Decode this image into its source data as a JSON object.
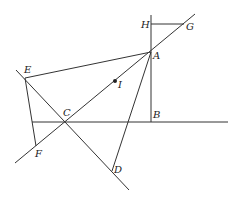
{
  "diagram": {
    "type": "geometry",
    "colors": {
      "line": "#333333",
      "label": "#222222",
      "background": "#ffffff"
    },
    "points": {
      "A": {
        "label": "A",
        "x": 151,
        "y": 52
      },
      "B": {
        "label": "B",
        "x": 151,
        "y": 122
      },
      "C": {
        "label": "C",
        "x": 65,
        "y": 122
      },
      "D": {
        "label": "D",
        "x": 112,
        "y": 171
      },
      "E": {
        "label": "E",
        "x": 25,
        "y": 78
      },
      "F": {
        "label": "F",
        "x": 36,
        "y": 146
      },
      "G": {
        "label": "G",
        "x": 184,
        "y": 24
      },
      "H": {
        "label": "H",
        "x": 151,
        "y": 24
      },
      "I": {
        "label": "I",
        "x": 115,
        "y": 81
      }
    },
    "segments": [
      "A-E",
      "A-D",
      "E-F",
      "E-D (extended)",
      "F-G (line through C, I, A)",
      "H-G",
      "vertical through H, A, B",
      "horizontal through C, B"
    ]
  }
}
